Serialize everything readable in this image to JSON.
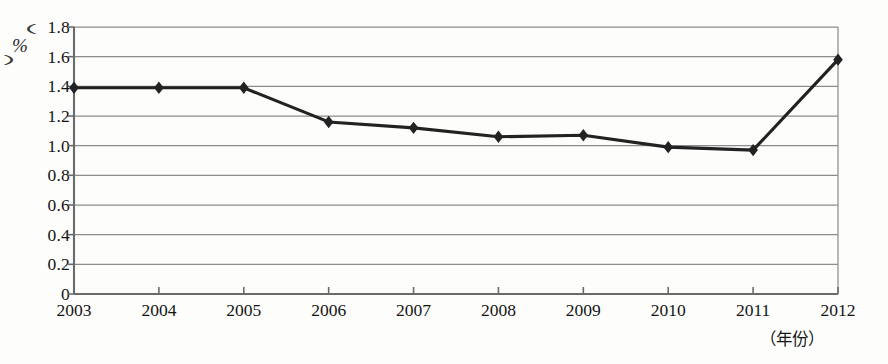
{
  "chart_data": {
    "type": "line",
    "title": "",
    "xlabel": "（年份）",
    "ylabel": "（%）",
    "categories": [
      "2003",
      "2004",
      "2005",
      "2006",
      "2007",
      "2008",
      "2009",
      "2010",
      "2011",
      "2012"
    ],
    "values": [
      1.39,
      1.39,
      1.39,
      1.16,
      1.12,
      1.06,
      1.07,
      0.99,
      0.97,
      1.58
    ],
    "series": [
      {
        "name": "",
        "values": [
          1.39,
          1.39,
          1.39,
          1.16,
          1.12,
          1.06,
          1.07,
          0.99,
          0.97,
          1.58
        ]
      }
    ],
    "ylim": [
      0,
      1.8
    ],
    "yticks": [
      "0",
      "0.2",
      "0.4",
      "0.6",
      "0.8",
      "1.0",
      "1.2",
      "1.4",
      "1.6",
      "1.8"
    ],
    "ytick_values": [
      0,
      0.2,
      0.4,
      0.6,
      0.8,
      1.0,
      1.2,
      1.4,
      1.6,
      1.8
    ],
    "grid": "horizontal",
    "legend": "none",
    "marker": "diamond",
    "line_color": "#222222",
    "grid_color": "#8c8c8c",
    "axis_color": "#5a5a5a"
  },
  "axes": {
    "y_unit_open": "（",
    "y_unit_symbol": "%",
    "y_unit_close": "）",
    "x_unit": "（年份）"
  },
  "caption": {
    "text": ""
  }
}
